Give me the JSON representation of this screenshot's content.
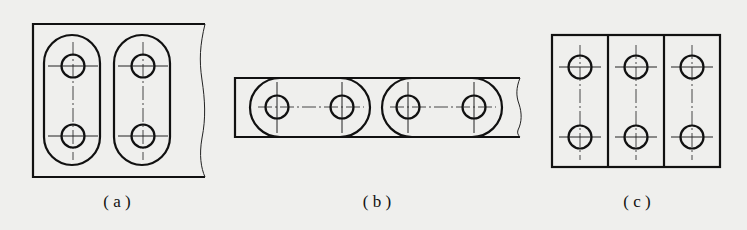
{
  "figure": {
    "background": "#efefed",
    "stroke_color": "#111111",
    "panels": [
      {
        "id": "a",
        "caption": "( a )",
        "description": "Plate with two vertical slotted (obround) outlines, each enclosing two holes on a vertical center line",
        "plate": {
          "x": 33,
          "y": 24,
          "w": 172,
          "h": 153,
          "broken_edge": "right"
        },
        "slots": [
          {
            "x": 44,
            "y": 35,
            "w": 56,
            "h": 130,
            "orientation": "vertical"
          },
          {
            "x": 114,
            "y": 35,
            "w": 56,
            "h": 130,
            "orientation": "vertical"
          }
        ],
        "holes": [
          {
            "cx": 73,
            "cy": 66,
            "r": 12
          },
          {
            "cx": 73,
            "cy": 136,
            "r": 12
          },
          {
            "cx": 143,
            "cy": 66,
            "r": 12
          },
          {
            "cx": 143,
            "cy": 136,
            "r": 12
          }
        ]
      },
      {
        "id": "b",
        "caption": "( b )",
        "description": "Long narrow strip with two horizontal slotted outlines, each enclosing two holes on a horizontal center line",
        "plate": {
          "x": 235,
          "y": 78,
          "w": 283,
          "h": 59,
          "broken_edge": "right"
        },
        "slots": [
          {
            "x": 250,
            "y": 78,
            "w": 120,
            "h": 59,
            "orientation": "horizontal"
          },
          {
            "x": 382,
            "y": 78,
            "w": 120,
            "h": 59,
            "orientation": "horizontal"
          }
        ],
        "holes": [
          {
            "cx": 277,
            "cy": 107,
            "r": 12
          },
          {
            "cx": 342,
            "cy": 107,
            "r": 12
          },
          {
            "cx": 408,
            "cy": 107,
            "r": 12
          },
          {
            "cx": 474,
            "cy": 107,
            "r": 12
          }
        ]
      },
      {
        "id": "c",
        "caption": "( c )",
        "description": "Rectangular plate split into three vertical rectangular regions, each with two holes on a vertical center line",
        "plate": {
          "x": 552,
          "y": 35,
          "w": 168,
          "h": 132,
          "broken_edge": "none"
        },
        "dividers": [
          608,
          664
        ],
        "holes": [
          {
            "cx": 580,
            "cy": 67,
            "r": 12
          },
          {
            "cx": 580,
            "cy": 137,
            "r": 12
          },
          {
            "cx": 636,
            "cy": 67,
            "r": 12
          },
          {
            "cx": 636,
            "cy": 137,
            "r": 12
          },
          {
            "cx": 692,
            "cy": 67,
            "r": 12
          },
          {
            "cx": 692,
            "cy": 137,
            "r": 12
          }
        ]
      }
    ]
  }
}
